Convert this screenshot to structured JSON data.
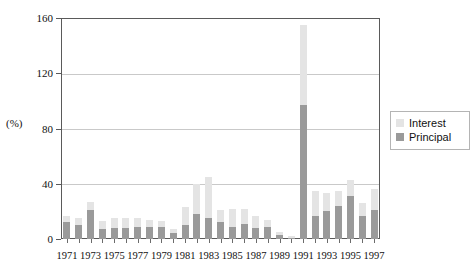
{
  "chart_data": {
    "type": "bar",
    "stacked": true,
    "title": "",
    "subtitle": "",
    "xlabel": "",
    "ylabel": "(%)",
    "ylim": [
      0,
      160
    ],
    "yticks": [
      0,
      40,
      80,
      120,
      160
    ],
    "grid": true,
    "legend_position": "right",
    "categories": [
      "1971",
      "1972",
      "1973",
      "1974",
      "1975",
      "1976",
      "1977",
      "1978",
      "1979",
      "1980",
      "1981",
      "1982",
      "1983",
      "1984",
      "1985",
      "1986",
      "1987",
      "1988",
      "1989",
      "1990",
      "1991",
      "1992",
      "1993",
      "1994",
      "1995",
      "1996",
      "1997"
    ],
    "tick_labels": [
      "1971",
      "1973",
      "1975",
      "1977",
      "1979",
      "1981",
      "1983",
      "1985",
      "1987",
      "1989",
      "1991",
      "1993",
      "1995",
      "1997"
    ],
    "series": [
      {
        "name": "Principal",
        "color": "#9a9a9a",
        "values": [
          12,
          10,
          21,
          7,
          8,
          8,
          9,
          9,
          9,
          4,
          10,
          18,
          15,
          12,
          9,
          11,
          8,
          9,
          3,
          1,
          97,
          17,
          20,
          24,
          31,
          17,
          21
        ]
      },
      {
        "name": "Interest",
        "color": "#e4e4e4",
        "values": [
          5,
          5,
          6,
          6,
          7,
          7,
          6,
          5,
          4,
          3,
          13,
          22,
          30,
          9,
          13,
          11,
          9,
          5,
          2,
          1,
          58,
          18,
          13,
          11,
          12,
          9,
          15
        ]
      }
    ],
    "totals": [
      17,
      15,
      27,
      13,
      15,
      15,
      15,
      14,
      13,
      7,
      23,
      40,
      45,
      21,
      22,
      22,
      17,
      14,
      5,
      2,
      155,
      35,
      33,
      35,
      43,
      26,
      36
    ]
  },
  "legend": {
    "items": [
      {
        "label": "Interest",
        "color": "#e4e4e4"
      },
      {
        "label": "Principal",
        "color": "#9a9a9a"
      }
    ]
  },
  "axis": {
    "y_unit_label": "(%)"
  }
}
